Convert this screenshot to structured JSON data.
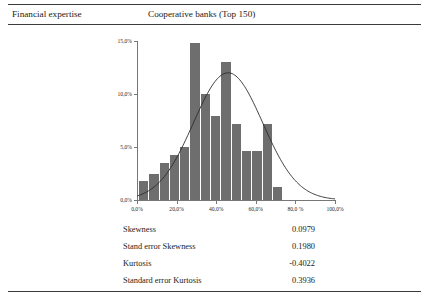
{
  "header": {
    "left_title": "Financial expertise",
    "center_title": "Cooperative banks (Top 150)"
  },
  "chart_data": {
    "type": "bar",
    "title": "",
    "subtitle": "",
    "xlabel": "",
    "ylabel": "",
    "unit_symbol": "%",
    "xlim": [
      0,
      100
    ],
    "ylim": [
      0,
      15
    ],
    "grid": false,
    "legend": false,
    "bar_color": "#6e6e6e",
    "curve_color": "#2b2b2b",
    "curve_label": "normal distribution curve",
    "ytick_labels": [
      "0,0%",
      "5,0%",
      "10,0%",
      "15,0%"
    ],
    "ytick_values": [
      0,
      5,
      10,
      15
    ],
    "xtick_labels": [
      "0,0%",
      "20,0%",
      "40,0%",
      "60,0%",
      "80,0 %",
      "100,0%"
    ],
    "xtick_values": [
      0,
      20,
      40,
      60,
      80,
      100
    ],
    "bin_width": 5.2,
    "bin_start": 1.0,
    "categories": [
      "1-6",
      "6-11",
      "11-17",
      "17-22",
      "22-27",
      "27-32",
      "32-38",
      "38-43",
      "43-48",
      "48-53",
      "53-59",
      "59-64",
      "64-69",
      "69-74"
    ],
    "values": [
      1.8,
      2.5,
      3.5,
      4.2,
      5.0,
      14.8,
      10.0,
      7.9,
      13.0,
      7.2,
      4.6,
      4.6,
      7.2,
      1.2
    ],
    "curve": {
      "mean": 46.0,
      "sigma": 17.5,
      "peak_value": 12.0
    }
  },
  "stats": {
    "rows": [
      {
        "label": "Skewness",
        "value": "0.0979"
      },
      {
        "label": "Stand error Skewness",
        "value": "0.1980"
      },
      {
        "label": "Kurtosis",
        "value": "-0.4022"
      },
      {
        "label": "Standard error Kurtosis",
        "value": "0.3936"
      }
    ]
  }
}
